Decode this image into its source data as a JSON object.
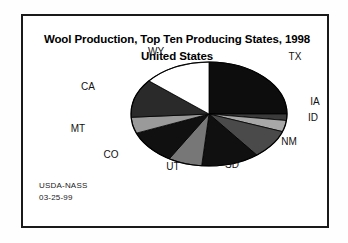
{
  "frame": {
    "border_color": "#1a1a1a"
  },
  "title": {
    "line1": "Wool Production, Top Ten Producing States, 1998",
    "line2": "United States"
  },
  "footer": {
    "agency": "USDA-NASS",
    "date": "03-25-99"
  },
  "chart_data": {
    "type": "pie",
    "title": "Wool Production, Top Ten Producing States, 1998 United States",
    "subtitle": "United States",
    "xlabel": "",
    "ylabel": "",
    "legend_position": "none",
    "grid": false,
    "labels_outside": true,
    "start_angle_deg": 0,
    "direction": "clockwise",
    "categories": [
      "TX",
      "IA",
      "ID",
      "NM",
      "SD",
      "UT",
      "CO",
      "MT",
      "CA",
      "WY"
    ],
    "values": [
      25.0,
      2.0,
      3.5,
      9.0,
      12.0,
      7.0,
      10.5,
      5.0,
      12.0,
      14.0
    ],
    "unit": "percent of top-ten wool production",
    "slices": [
      {
        "label": "TX",
        "value": 25.0,
        "start_deg": 0.0,
        "end_deg": 90.0,
        "fill": "#0d0d0d",
        "label_x": 272,
        "label_y": 40
      },
      {
        "label": "IA",
        "value": 2.0,
        "start_deg": 90.0,
        "end_deg": 97.2,
        "fill": "#3b3b3b",
        "label_x": 292,
        "label_y": 85
      },
      {
        "label": "ID",
        "value": 3.5,
        "start_deg": 97.2,
        "end_deg": 109.8,
        "fill": "#a8a8a8",
        "label_x": 290,
        "label_y": 101
      },
      {
        "label": "NM",
        "value": 9.0,
        "start_deg": 109.8,
        "end_deg": 142.2,
        "fill": "#4a4a4a",
        "label_x": 266,
        "label_y": 125
      },
      {
        "label": "SD",
        "value": 12.0,
        "start_deg": 142.2,
        "end_deg": 185.4,
        "fill": "#101010",
        "label_x": 209,
        "label_y": 148
      },
      {
        "label": "UT",
        "value": 7.0,
        "start_deg": 185.4,
        "end_deg": 210.6,
        "fill": "#777777",
        "label_x": 150,
        "label_y": 150
      },
      {
        "label": "CO",
        "value": 10.5,
        "start_deg": 210.6,
        "end_deg": 248.4,
        "fill": "#101010",
        "label_x": 88,
        "label_y": 138
      },
      {
        "label": "MT",
        "value": 5.0,
        "start_deg": 248.4,
        "end_deg": 266.4,
        "fill": "#9a9a9a",
        "label_x": 55,
        "label_y": 112
      },
      {
        "label": "CA",
        "value": 12.0,
        "start_deg": 266.4,
        "end_deg": 309.6,
        "fill": "#2a2a2a",
        "label_x": 65,
        "label_y": 70
      },
      {
        "label": "WY",
        "value": 14.0,
        "start_deg": 309.6,
        "end_deg": 360.0,
        "fill": "#ffffff",
        "label_x": 133,
        "label_y": 35
      }
    ],
    "geometry": {
      "cx": 186,
      "cy": 98,
      "rx": 78,
      "ry": 52
    }
  }
}
